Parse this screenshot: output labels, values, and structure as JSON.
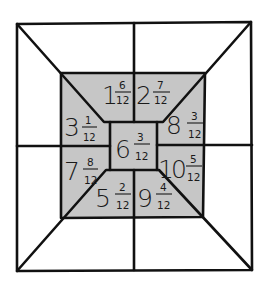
{
  "diagram": {
    "colors": {
      "background": "#ffffff",
      "shaded": "#c6c6c6",
      "line": "#111111",
      "text": "#1a1a1a"
    },
    "cells": [
      {
        "id": "top-left-inner",
        "whole": "1",
        "numerator": "6",
        "denominator": "12"
      },
      {
        "id": "top-right-inner",
        "whole": "2",
        "numerator": "7",
        "denominator": "12"
      },
      {
        "id": "left-upper",
        "whole": "3",
        "numerator": "1",
        "denominator": "12"
      },
      {
        "id": "right-upper",
        "whole": "8",
        "numerator": "3",
        "denominator": "12"
      },
      {
        "id": "center",
        "whole": "6",
        "numerator": "3",
        "denominator": "12"
      },
      {
        "id": "left-lower",
        "whole": "7",
        "numerator": "8",
        "denominator": "12"
      },
      {
        "id": "right-lower",
        "whole": "10",
        "numerator": "5",
        "denominator": "12"
      },
      {
        "id": "bottom-left-inner",
        "whole": "5",
        "numerator": "2",
        "denominator": "12"
      },
      {
        "id": "bottom-right-inner",
        "whole": "9",
        "numerator": "4",
        "denominator": "12"
      }
    ],
    "outer_blank_regions": 12
  }
}
